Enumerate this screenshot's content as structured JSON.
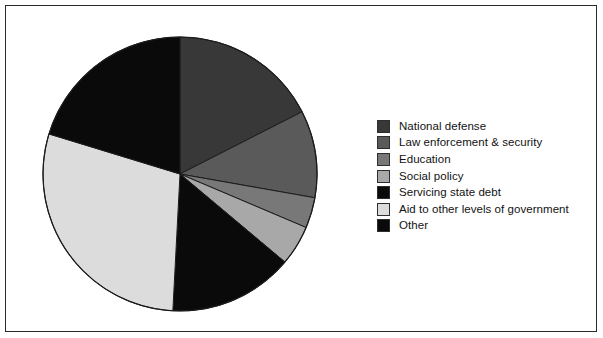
{
  "figure": {
    "frame_border_color": "#2b2b2b",
    "background_color": "#ffffff"
  },
  "chart_data": {
    "type": "pie",
    "title": "",
    "subtitle": "",
    "xlabel": "",
    "ylabel": "",
    "grid": false,
    "legend_position": "right",
    "start_angle_deg": 0,
    "direction": "clockwise",
    "center": {
      "x": 174,
      "y": 168
    },
    "radius": 137,
    "slice_edge_color": "#1c1c1c",
    "categories": [
      "National defense",
      "Law enforcement & security",
      "Education",
      "Social policy",
      "Servicing state debt",
      "Aid to other levels of government",
      "Other"
    ],
    "values": [
      17.5,
      10.3,
      3.6,
      4.7,
      14.7,
      28.9,
      20.3
    ],
    "angles_deg": [
      63.0,
      37.0,
      13.0,
      17.0,
      53.0,
      104.0,
      73.0
    ],
    "colors": [
      "#383838",
      "#5a5a5a",
      "#787878",
      "#a8a8a8",
      "#0a0a0a",
      "#dcdcdc",
      "#0a0a0a"
    ],
    "slices": [
      {
        "label": "National defense",
        "value": 17.5,
        "angle_deg": 63.0,
        "color": "#383838",
        "start_deg": 0.0,
        "end_deg": 63.0
      },
      {
        "label": "Law enforcement & security",
        "value": 10.3,
        "angle_deg": 37.0,
        "color": "#5a5a5a",
        "start_deg": 63.0,
        "end_deg": 100.0
      },
      {
        "label": "Education",
        "value": 3.6,
        "angle_deg": 13.0,
        "color": "#787878",
        "start_deg": 100.0,
        "end_deg": 113.0
      },
      {
        "label": "Social policy",
        "value": 4.7,
        "angle_deg": 17.0,
        "color": "#a8a8a8",
        "start_deg": 113.0,
        "end_deg": 130.0
      },
      {
        "label": "Servicing state debt",
        "value": 14.7,
        "angle_deg": 53.0,
        "color": "#0a0a0a",
        "start_deg": 130.0,
        "end_deg": 183.0
      },
      {
        "label": "Aid to other levels of government",
        "value": 28.9,
        "angle_deg": 104.0,
        "color": "#dcdcdc",
        "start_deg": 183.0,
        "end_deg": 287.0
      },
      {
        "label": "Other",
        "value": 20.3,
        "angle_deg": 73.0,
        "color": "#0a0a0a",
        "start_deg": 287.0,
        "end_deg": 360.0
      }
    ]
  },
  "legend": {
    "items": [
      {
        "label": "National defense",
        "color": "#383838"
      },
      {
        "label": "Law enforcement & security",
        "color": "#5a5a5a"
      },
      {
        "label": "Education",
        "color": "#787878"
      },
      {
        "label": "Social policy",
        "color": "#a8a8a8"
      },
      {
        "label": "Servicing state debt",
        "color": "#0a0a0a"
      },
      {
        "label": "Aid to other levels of government",
        "color": "#dcdcdc"
      },
      {
        "label": "Other",
        "color": "#0a0a0a"
      }
    ]
  }
}
